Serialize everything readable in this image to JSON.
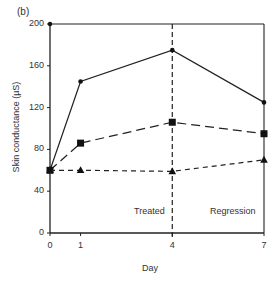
{
  "chart_data": {
    "type": "line",
    "panel_label": "(b)",
    "title": "",
    "xlabel": "Day",
    "ylabel": "Skin conductance (µS)",
    "x": [
      0,
      1,
      4,
      7
    ],
    "x_tick_labels": [
      "0",
      "1",
      "4",
      "7"
    ],
    "y_ticks": [
      0,
      40,
      80,
      120,
      160,
      200
    ],
    "ylim": [
      0,
      200
    ],
    "grid": false,
    "legend": "none",
    "series": [
      {
        "name": "circle-solid",
        "marker": "circle",
        "line": "solid",
        "values": [
          60,
          145,
          175,
          125
        ]
      },
      {
        "name": "square-long-dash",
        "marker": "square",
        "line": "long-dash",
        "values": [
          60,
          86,
          106,
          95
        ]
      },
      {
        "name": "triangle-short-dash",
        "marker": "triangle",
        "line": "short-dash",
        "values": [
          60,
          60,
          59,
          70
        ]
      }
    ],
    "annotations": [
      {
        "text": "Treated",
        "region": "day 0-4"
      },
      {
        "text": "Regression",
        "region": "day 4-7"
      },
      {
        "type": "vertical-dashed-line",
        "x": 4
      }
    ]
  }
}
